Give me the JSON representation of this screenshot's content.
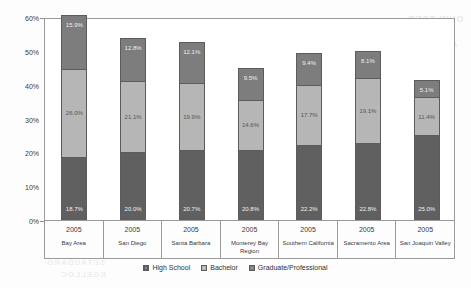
{
  "chart_data": {
    "type": "bar",
    "stacked": true,
    "title": "",
    "xlabel": "",
    "ylabel": "",
    "ylim": [
      0,
      60
    ],
    "ytick_labels": [
      "0%",
      "10%",
      "20%",
      "30%",
      "40%",
      "50%",
      "60%"
    ],
    "ytick_values": [
      0,
      10,
      20,
      30,
      40,
      50,
      60
    ],
    "grid": false,
    "legend_position": "bottom",
    "categories": [
      "Bay Area",
      "San Diego",
      "Santa Barbara",
      "Monterey Bay Region",
      "Southern California",
      "Sacramento Area",
      "San Joaquin Valley"
    ],
    "category_years": [
      "2005",
      "2005",
      "2005",
      "2005",
      "2005",
      "2005",
      "2005"
    ],
    "series": [
      {
        "name": "High School",
        "color": "#606060",
        "values": [
          18.7,
          20.0,
          20.7,
          20.8,
          22.2,
          22.8,
          25.0
        ],
        "labels": [
          "18.7%",
          "20.0%",
          "20.7%",
          "20.8%",
          "22.2%",
          "22.8%",
          "25.0%"
        ]
      },
      {
        "name": "Bachelor",
        "color": "#b6b6b6",
        "values": [
          26.0,
          21.1,
          19.9,
          14.6,
          17.7,
          19.1,
          11.4
        ],
        "labels": [
          "26.0%",
          "21.1%",
          "19.9%",
          "14.6%",
          "17.7%",
          "19.1%",
          "11.4%"
        ]
      },
      {
        "name": "Graduate/Professional",
        "color": "#7d7d7d",
        "values": [
          15.9,
          12.8,
          12.1,
          9.5,
          9.4,
          8.1,
          5.1
        ],
        "labels": [
          "15.9%",
          "12.8%",
          "12.1%",
          "9.5%",
          "9.4%",
          "8.1%",
          "5.1%"
        ]
      }
    ],
    "totals": [
      60.6,
      53.9,
      52.7,
      44.9,
      49.3,
      50.0,
      41.5
    ]
  },
  "legend": {
    "items": [
      {
        "label": "High School"
      },
      {
        "label": "Bachelor"
      },
      {
        "label": "Graduate/Professional"
      }
    ]
  },
  "artifacts": {
    "ghost_a": "OHW TSEB",
    "ghost_b": "SROTCOD",
    "ghost_c": "AINROFILAC",
    "ghost_d": "SETAUDARG",
    "ghost_e": "EGELLOC",
    "ghost_f": "noigeR"
  }
}
